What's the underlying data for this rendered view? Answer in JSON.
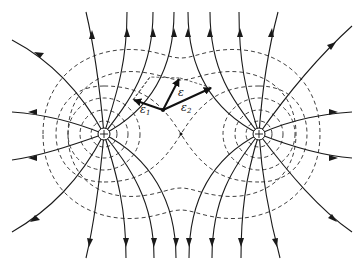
{
  "figure": {
    "charges": [
      {
        "id": "left",
        "sign": "+",
        "x": 104,
        "y": 134
      },
      {
        "id": "right",
        "sign": "+",
        "x": 259,
        "y": 134
      }
    ],
    "point": {
      "x": 163,
      "y": 110
    },
    "vectors": [
      {
        "id": "E1",
        "label": "ε",
        "subscript": "1"
      },
      {
        "id": "E2",
        "label": "ε",
        "subscript": "2"
      },
      {
        "id": "E",
        "label": "ε",
        "subscript": ""
      }
    ],
    "legend": {
      "solid": "electric field lines",
      "dashed": "equipotential lines"
    }
  }
}
